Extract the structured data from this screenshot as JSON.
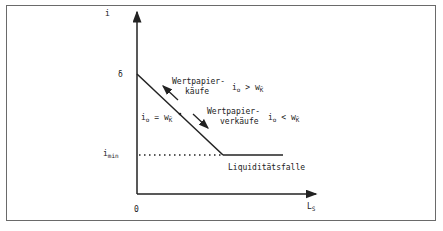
{
  "diagram": {
    "y_axis": {
      "label": "i"
    },
    "x_axis": {
      "label": "L",
      "label_sub": "S"
    },
    "origin_label": "0",
    "intercept_label": "δ",
    "i_min": {
      "label": "i",
      "label_sub": "min"
    },
    "annotations": {
      "purchases": {
        "line1": "Wertpapier-",
        "line2": "käufe"
      },
      "sales": {
        "line1": "Wertpapier-",
        "line2": "verkäufe"
      },
      "cond_greater": {
        "lhs": "i",
        "lhs_sub": "o",
        "op": ">",
        "rhs": "w",
        "rhs_sub": "K̄"
      },
      "cond_equal": {
        "lhs": "i",
        "lhs_sub": "o",
        "op": "=",
        "rhs": "w",
        "rhs_sub": "K̄"
      },
      "cond_less": {
        "lhs": "i",
        "lhs_sub": "o",
        "op": "<",
        "rhs": "w",
        "rhs_sub": "K̄"
      },
      "liquidity_trap": "Liquiditätsfalle"
    },
    "colors": {
      "line": "#222222",
      "frame": "#6a6a6a",
      "background": "#ffffff"
    }
  }
}
